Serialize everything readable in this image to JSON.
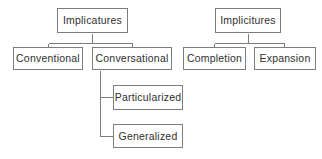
{
  "diagram": {
    "type": "hierarchy-tree",
    "style": {
      "box_border_color": "#7d7d7d",
      "box_fill_color": "#ffffff",
      "connector_color": "#7d7d7d",
      "text_color": "#2f2f2f",
      "background_color": "#ffffff"
    },
    "trees": [
      {
        "name": "implicatures-tree",
        "root": "Implicatures",
        "nodes": {
          "root": "Implicatures",
          "child_1": "Conventional",
          "child_2": "Conversational",
          "grandchild_1": "Particularized",
          "grandchild_2": "Generalized"
        }
      },
      {
        "name": "implicitures-tree",
        "root": "Implicitures",
        "nodes": {
          "root": "Implicitures",
          "child_1": "Completion",
          "child_2": "Expansion"
        }
      }
    ]
  }
}
